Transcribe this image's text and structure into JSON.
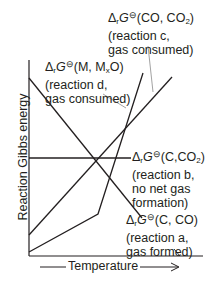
{
  "axes": {
    "ylabel": "Reaction Gibbs energy",
    "xlabel": "Temperature"
  },
  "labels": {
    "c": {
      "symbol": "Δ",
      "sub_r": "r",
      "G": "G",
      "std": "⊖",
      "species": "(CO, CO",
      "species_sub": "2",
      "species_end": ")",
      "line2": "(reaction c,",
      "line3": "gas consumed)"
    },
    "d": {
      "symbol": "Δ",
      "sub_r": "r",
      "G": "G",
      "std": "⊖",
      "species": "(M, M",
      "species_sub": "x",
      "species_end": "O)",
      "line2": "(reaction d,",
      "line3": "gas consumed)"
    },
    "b": {
      "symbol": "Δ",
      "sub_r": "r",
      "G": "G",
      "std": "⊖",
      "species": "(C,CO",
      "species_sub": "2",
      "species_end": ")",
      "line2": "(reaction b,",
      "line3": "no net gas",
      "line4": "formation)"
    },
    "a": {
      "symbol": "Δ",
      "sub_r": "r",
      "G": "G",
      "std": "⊖",
      "species": "(C, CO)",
      "line2": "(reaction a,",
      "line3": "gas formed)"
    }
  },
  "colors": {
    "ink": "#231f20",
    "leader": "#8a8a8a"
  }
}
